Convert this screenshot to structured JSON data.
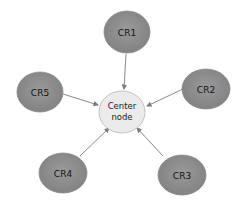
{
  "diagram": {
    "type": "star-network",
    "center": {
      "label_line1": "Center",
      "label_line2": "node",
      "fill": "#ebebeb",
      "stroke": "#b5b5b5"
    },
    "nodes": [
      {
        "id": "CR1",
        "label": "CR1"
      },
      {
        "id": "CR2",
        "label": "CR2"
      },
      {
        "id": "CR3",
        "label": "CR3"
      },
      {
        "id": "CR4",
        "label": "CR4"
      },
      {
        "id": "CR5",
        "label": "CR5"
      }
    ],
    "node_fill": "#8c8c8c",
    "edge_color": "#7a7a7a",
    "edges": [
      {
        "from": "CR1",
        "to": "Center node"
      },
      {
        "from": "CR2",
        "to": "Center node"
      },
      {
        "from": "CR3",
        "to": "Center node"
      },
      {
        "from": "CR4",
        "to": "Center node"
      },
      {
        "from": "CR5",
        "to": "Center node"
      }
    ]
  }
}
